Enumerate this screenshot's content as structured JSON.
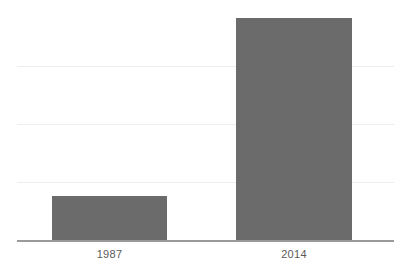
{
  "chart_data": {
    "type": "bar",
    "title": "",
    "subtitle": "",
    "xlabel": "",
    "ylabel": "",
    "categories": [
      "1987",
      "2014"
    ],
    "values": [
      0.76,
      3.83
    ],
    "series": [
      {
        "name": "",
        "values": [
          0.76,
          3.83
        ]
      }
    ],
    "ylim": [
      0,
      4
    ],
    "yticks": [
      1,
      2,
      3
    ],
    "ytick_labels": [
      "",
      "",
      ""
    ],
    "grid": true,
    "gridlines_count": 3,
    "legend": false,
    "legend_position": "none",
    "annotations": [],
    "bar_color": "#6b6b6b",
    "gridline_color": "#ededed",
    "axis_color": "#9a9a9a",
    "label_color": "#5a5a5a",
    "background_color": "#ffffff"
  },
  "axis": {
    "x_tick_labels": [
      "1987",
      "2014"
    ]
  }
}
